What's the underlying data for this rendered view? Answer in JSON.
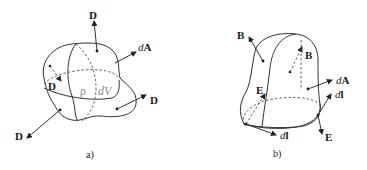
{
  "panels": {
    "a": {
      "caption": "a)",
      "labels": {
        "d_top": "D",
        "dA": "A",
        "dA_prefix": "d",
        "d_inner": "D",
        "rho": "ρ",
        "dV": "dV",
        "d_right": "D",
        "d_bottom_left": "D"
      }
    },
    "b": {
      "caption": "b)",
      "labels": {
        "b_outer": "B",
        "b_inner": "B",
        "dA": "A",
        "dA_prefix": "d",
        "dl_right": "l",
        "dl_right_prefix": "d",
        "e_right": "E",
        "e_left": "E",
        "dl_bottom": "l",
        "dl_bottom_prefix": "d"
      }
    }
  }
}
